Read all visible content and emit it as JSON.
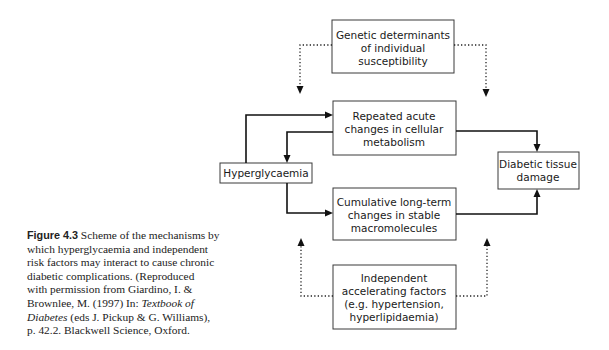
{
  "figure": {
    "label": "Figure 4.3",
    "caption_lines": [
      " Scheme of the mechanisms by",
      "which hyperglycaemia and independent",
      "risk factors may interact to cause chronic",
      "diabetic complications. (Reproduced",
      "with permission from Giardino, I. &",
      "Brownlee, M. (1997) In: "
    ],
    "caption_italic_1": "Textbook of",
    "caption_italic_2": "Diabetes",
    "caption_line7_rest": " (eds J. Pickup & G. Williams),",
    "caption_line8": "p. 42.2. Blackwell Science, Oxford."
  },
  "nodes": {
    "genetic": {
      "lines": [
        "Genetic determinants",
        "of individual",
        "susceptibility"
      ]
    },
    "acute": {
      "lines": [
        "Repeated acute",
        "changes in cellular",
        "metabolism"
      ]
    },
    "hyperglycaemia": {
      "lines": [
        "Hyperglycaemia"
      ]
    },
    "cumulative": {
      "lines": [
        "Cumulative long-term",
        "changes in stable",
        "macromolecules"
      ]
    },
    "damage": {
      "lines": [
        "Diabetic tissue",
        "damage"
      ]
    },
    "independent": {
      "lines": [
        "Independent",
        "accelerating factors",
        "(e.g. hypertension,",
        "hyperlipidaemia)"
      ]
    }
  },
  "edges": [
    {
      "from": "hyperglycaemia",
      "to": "acute",
      "style": "solid"
    },
    {
      "from": "acute",
      "to": "hyperglycaemia",
      "style": "solid"
    },
    {
      "from": "hyperglycaemia",
      "to": "cumulative",
      "style": "solid"
    },
    {
      "from": "acute",
      "to": "damage",
      "style": "solid"
    },
    {
      "from": "cumulative",
      "to": "damage",
      "style": "solid"
    },
    {
      "from": "genetic",
      "to": "acute",
      "style": "dotted"
    },
    {
      "from": "genetic",
      "to": "damage",
      "style": "dotted"
    },
    {
      "from": "independent",
      "to": "cumulative",
      "style": "dotted"
    },
    {
      "from": "independent",
      "to": "damage",
      "style": "dotted"
    }
  ]
}
